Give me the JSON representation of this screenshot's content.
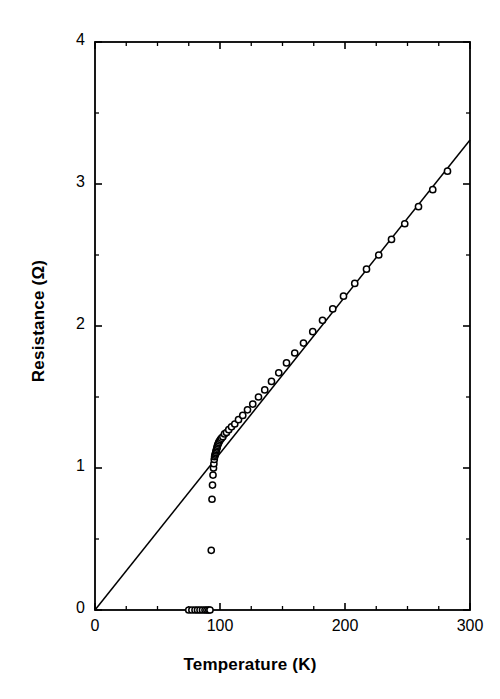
{
  "chart_data": {
    "type": "scatter",
    "title": "",
    "xlabel": "Temperature  (K)",
    "ylabel": "Resistance  (Ω)",
    "xlabel_text": "Temperature",
    "xlabel_unit": "(K)",
    "ylabel_text": "Resistance",
    "ylabel_unit": "(Ω)",
    "xlim": [
      0,
      300
    ],
    "ylim": [
      0,
      4
    ],
    "xticks": [
      0,
      100,
      200,
      300
    ],
    "yticks": [
      0,
      1,
      2,
      3,
      4
    ],
    "xtick_labels": [
      "0",
      "100",
      "200",
      "300"
    ],
    "ytick_labels": [
      "0",
      "1",
      "2",
      "3",
      "4"
    ],
    "x_minor_step": 25,
    "y_minor_step": 0.5,
    "grid": false,
    "legend": null,
    "marker": "open-circle",
    "marker_edge_color": "#000000",
    "marker_face_color": "#ffffff",
    "line_color": "#000000",
    "axis_color": "#000000",
    "background_color": "#ffffff",
    "series": [
      {
        "name": "Resistance data",
        "style": "markers",
        "x": [
          75.0,
          77.5,
          80.0,
          82.0,
          84.0,
          86.0,
          88.0,
          89.5,
          91.0,
          92.0,
          93.0,
          93.6,
          94.0,
          94.4,
          94.8,
          95.1,
          95.4,
          95.7,
          96.0,
          96.3,
          96.6,
          96.9,
          97.2,
          97.5,
          97.8,
          98.1,
          98.5,
          99.0,
          99.6,
          100.3,
          101.2,
          102.3,
          103.6,
          105.2,
          107.0,
          109.2,
          111.8,
          114.8,
          118.2,
          122.0,
          126.2,
          130.8,
          135.8,
          141.2,
          147.0,
          153.2,
          159.8,
          166.8,
          174.2,
          182.0,
          190.2,
          198.8,
          207.8,
          217.2,
          227.0,
          237.2,
          247.8,
          258.8,
          270.2,
          282.0
        ],
        "y": [
          0.0,
          0.0,
          0.0,
          0.0,
          0.0,
          0.0,
          0.0,
          0.0,
          0.0,
          0.0,
          0.42,
          0.78,
          0.88,
          0.95,
          1.0,
          1.03,
          1.06,
          1.08,
          1.09,
          1.1,
          1.11,
          1.12,
          1.13,
          1.14,
          1.15,
          1.16,
          1.17,
          1.18,
          1.19,
          1.2,
          1.21,
          1.22,
          1.24,
          1.25,
          1.27,
          1.29,
          1.31,
          1.34,
          1.37,
          1.41,
          1.45,
          1.5,
          1.55,
          1.61,
          1.67,
          1.74,
          1.81,
          1.88,
          1.96,
          2.04,
          2.12,
          2.21,
          2.3,
          2.4,
          2.5,
          2.61,
          2.72,
          2.84,
          2.96,
          3.09
        ]
      },
      {
        "name": "Linear fit",
        "style": "line",
        "x": [
          0,
          300
        ],
        "y": [
          0.0,
          3.31
        ],
        "slope": 0.01103,
        "intercept": 0.0
      }
    ],
    "annotations": [
      {
        "text": "superconducting transition near 95 K",
        "x": 95,
        "y": 0.5
      }
    ]
  },
  "axis_titles": {
    "x": "Temperature  (K)",
    "y": "Resistance  (Ω)"
  }
}
